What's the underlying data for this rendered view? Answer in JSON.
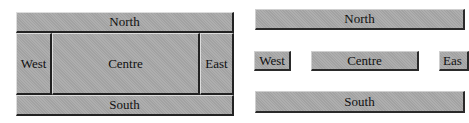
{
  "left_layout": {
    "north": "North",
    "west": "West",
    "centre": "Centre",
    "east": "East",
    "south": "South"
  },
  "right_layout": {
    "north": "North",
    "west": "West",
    "centre": "Centre",
    "east": "Eas",
    "south": "South"
  },
  "colors": {
    "panel": "#a9a9a9",
    "border": "#222222",
    "background": "#ffffff"
  }
}
